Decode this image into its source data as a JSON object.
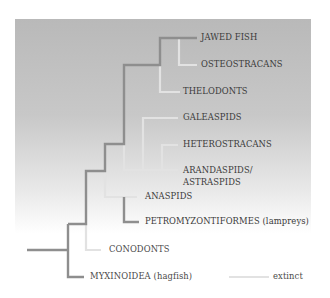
{
  "diagram": {
    "type": "cladogram",
    "colors": {
      "extant_line": "#8e8e8e",
      "extinct_line": "#e2e2e2",
      "panel_top": "#b9b9b9",
      "panel_bottom": "#ffffff",
      "text": "#3a3a3a"
    },
    "taxa": [
      {
        "id": "jawed_fish",
        "label": "JAWED FISH",
        "status": "extant"
      },
      {
        "id": "osteostracans",
        "label": "OSTEOSTRACANS",
        "status": "extinct"
      },
      {
        "id": "thelodonts",
        "label": "THELODONTS",
        "status": "extinct"
      },
      {
        "id": "galeaspids",
        "label": "GALEASPIDS",
        "status": "extinct"
      },
      {
        "id": "heterostracans",
        "label": "HETEROSTRACANS",
        "status": "extinct"
      },
      {
        "id": "arandaspids",
        "label": "ARANDASPIDS/",
        "label_line2": "ASTRASPIDS",
        "status": "extinct"
      },
      {
        "id": "anaspids",
        "label": "ANASPIDS",
        "status": "extinct"
      },
      {
        "id": "petromyzontiformes",
        "label": "PETROMYZONTIFORMES (lampreys)",
        "status": "extant"
      },
      {
        "id": "conodonts",
        "label": "CONODONTS",
        "status": "extinct"
      },
      {
        "id": "myxinoidea",
        "label": "MYXINOIDEA (hagfish)",
        "status": "extant"
      }
    ],
    "legend": {
      "extinct_label": "extinct"
    }
  }
}
